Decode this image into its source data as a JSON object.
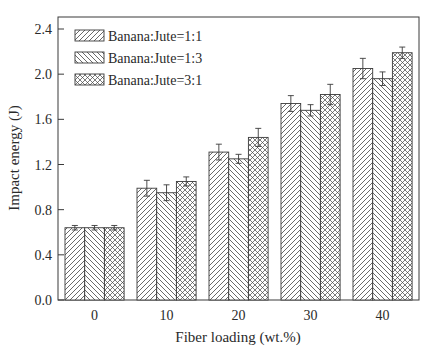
{
  "chart_data": {
    "type": "bar",
    "title": "",
    "xlabel": "Fiber loading (wt.%)",
    "ylabel": "Impact energy (J)",
    "categories": [
      "0",
      "10",
      "20",
      "30",
      "40"
    ],
    "ylim": [
      0.0,
      2.4
    ],
    "yticks": [
      "0.0",
      "0.4",
      "0.8",
      "1.2",
      "1.6",
      "2.0",
      "2.4"
    ],
    "grid": false,
    "legend_position": "upper left",
    "series": [
      {
        "name": "Banana:Jute=1:1",
        "pattern": "forward-diagonal-hatch",
        "values": [
          0.64,
          0.99,
          1.31,
          1.74,
          2.05
        ],
        "errors": [
          0.02,
          0.07,
          0.07,
          0.07,
          0.09
        ]
      },
      {
        "name": "Banana:Jute=1:3",
        "pattern": "back-diagonal-hatch",
        "values": [
          0.64,
          0.95,
          1.25,
          1.68,
          1.96
        ],
        "errors": [
          0.02,
          0.07,
          0.04,
          0.05,
          0.06
        ]
      },
      {
        "name": "Banana:Jute=3:1",
        "pattern": "cross-hatch",
        "values": [
          0.64,
          1.05,
          1.44,
          1.82,
          2.19
        ],
        "errors": [
          0.02,
          0.04,
          0.08,
          0.09,
          0.05
        ]
      }
    ]
  },
  "colors": {
    "axis": "#3a3a3a",
    "bar_stroke": "#3a3a3a",
    "hatch": "#444444",
    "background": "#ffffff"
  }
}
